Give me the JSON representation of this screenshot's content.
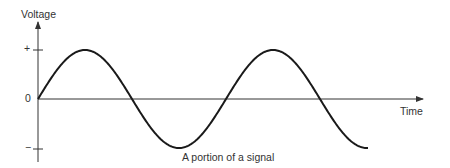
{
  "chart_data": {
    "type": "line",
    "title": "A portion of a signal",
    "xlabel": "Time",
    "ylabel": "Voltage",
    "yticks": [
      "+",
      "0",
      "−"
    ],
    "grid": false,
    "legend": null,
    "series": [
      {
        "name": "signal",
        "shape": "sine",
        "cycles": 1.9,
        "amplitude": 1,
        "start_phase": 0
      }
    ],
    "ylim": [
      -1,
      1
    ]
  },
  "labels": {
    "ylabel": "Voltage",
    "xlabel": "Time",
    "caption": "A portion of a signal",
    "tick_plus": "+",
    "tick_zero": "0",
    "tick_minus": "−"
  },
  "colors": {
    "line": "#1a1a1a",
    "axis": "#333333"
  }
}
